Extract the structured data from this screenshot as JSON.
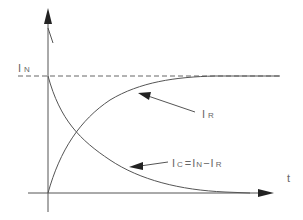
{
  "diagram": {
    "type": "current-vs-time",
    "colors": {
      "line": "#555555",
      "text": "#666666",
      "background": "#ffffff"
    },
    "axes": {
      "x_label": "t",
      "origin": [
        48,
        193
      ],
      "x_end": 272,
      "y_end": 10
    },
    "labels": {
      "i_n": {
        "main": "I",
        "sub": "N"
      },
      "i_r": {
        "main": "I",
        "sub": "R"
      },
      "i_c_equation": {
        "lhs_main": "I",
        "lhs_sub": "C",
        "eq": "=",
        "a_main": "I",
        "a_sub": "N",
        "minus": "−",
        "b_main": "I",
        "b_sub": "R"
      }
    },
    "curves": [
      {
        "name": "I_R",
        "description": "rising exponential from 0 to I_N"
      },
      {
        "name": "I_C",
        "description": "decaying exponential from I_N to 0"
      }
    ],
    "reference_line": {
      "name": "I_N",
      "style": "dashed"
    }
  }
}
